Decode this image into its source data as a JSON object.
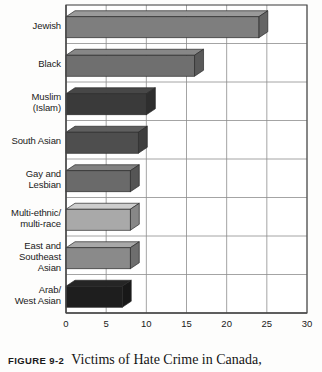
{
  "chart_data": {
    "type": "bar",
    "orientation": "horizontal",
    "style": "3d-bar",
    "title": "",
    "xlabel": "",
    "ylabel": "",
    "xlim": [
      0,
      30
    ],
    "xticks": [
      0,
      5,
      10,
      15,
      20,
      25,
      30
    ],
    "grid": true,
    "grid_axis": "x",
    "legend": "none",
    "categories": [
      "Jewish",
      "Black",
      "Muslim\n(Islam)",
      "South Asian",
      "Gay and\nLesbian",
      "Multi-ethnic/\nmulti-race",
      "East and\nSoutheast\nAsian",
      "Arab/\nWest Asian"
    ],
    "values": [
      24,
      16,
      10,
      9,
      8,
      8,
      8,
      7
    ],
    "bar_colors": [
      "#7e7e7e",
      "#6f6f6f",
      "#3a3a3a",
      "#4e4e4e",
      "#6a6a6a",
      "#a9a9a9",
      "#8a8a8a",
      "#1e1e1e"
    ]
  },
  "caption": {
    "tag": "FIGURE 9-2",
    "text": "Victims of Hate Crime in Canada,"
  },
  "colors": {
    "axis": "#4a4a4a",
    "gridline": "#8d8d8d",
    "text": "#1a1a1a",
    "background": "#fdfdfc"
  }
}
